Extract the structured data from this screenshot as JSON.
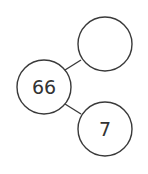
{
  "diagram": {
    "type": "number-bond",
    "colors": {
      "stroke": "#3a3a3a",
      "text": "#333333",
      "background": "#ffffff"
    },
    "nodes": [
      {
        "id": "whole",
        "label": "66",
        "cx": 44,
        "cy": 87,
        "r": 27
      },
      {
        "id": "part-top",
        "label": "",
        "cx": 105,
        "cy": 44,
        "r": 27
      },
      {
        "id": "part-bottom",
        "label": "7",
        "cx": 105,
        "cy": 129,
        "r": 27
      }
    ],
    "edges": [
      {
        "from": "whole",
        "to": "part-top"
      },
      {
        "from": "whole",
        "to": "part-bottom"
      }
    ]
  }
}
